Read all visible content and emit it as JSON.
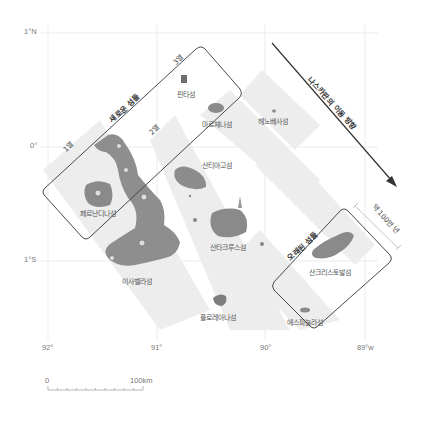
{
  "map": {
    "title": "갈라파고스 제도 섬의 나이 분포",
    "axes": {
      "lat_labels": [
        "1°N",
        "0°",
        "1°S"
      ],
      "lon_labels": [
        "92°",
        "91°",
        "90°",
        "89°w"
      ]
    },
    "columns": [
      "1열",
      "2열",
      "3열"
    ],
    "groups": {
      "young": "새로운 섬들",
      "old": "오래된 섬들"
    },
    "plate_motion": "나스카판의 이동 방향",
    "age_span": "약 100만 년",
    "islands": [
      {
        "name": "핀타섬"
      },
      {
        "name": "마르체나섬"
      },
      {
        "name": "헤노베사섬"
      },
      {
        "name": "산티아고섬"
      },
      {
        "name": "페르난디나섬"
      },
      {
        "name": "산타크루스섬"
      },
      {
        "name": "이사벨라섬"
      },
      {
        "name": "산크리스토발섬"
      },
      {
        "name": "플로레아나섬"
      },
      {
        "name": "에스파뇰라섬"
      }
    ],
    "scale_bar": {
      "start": "0",
      "end": "100km"
    },
    "colors": {
      "band": "#ececec",
      "grid": "#e4e4e4",
      "island": "#8a8a8a",
      "frame": "#4a4a4a",
      "arrow": "#333333"
    }
  }
}
